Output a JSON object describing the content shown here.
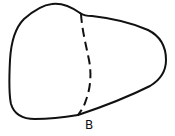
{
  "diagram": {
    "stroke_color": "#111111",
    "background_color": "#ffffff",
    "labels": {
      "point_b": "B"
    }
  }
}
